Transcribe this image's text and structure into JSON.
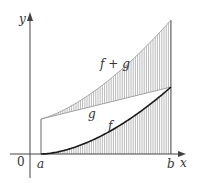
{
  "figure": {
    "type": "sum of functions area diagram",
    "axes": {
      "x_label": "x",
      "y_label": "y",
      "origin_label": "0"
    },
    "interval": {
      "start_label": "a",
      "end_label": "b"
    },
    "curves": [
      {
        "name": "f",
        "label": "f",
        "description": "increasing convex curve from 0 at a",
        "color": "#1a1a1a"
      },
      {
        "name": "g",
        "label": "g",
        "description": "straight increasing line",
        "color": "#999999"
      },
      {
        "name": "f_plus_g",
        "label": "f + g",
        "description": "sum curve, top boundary",
        "color": "#999999"
      }
    ],
    "shading": "vertical hatching under f and between g and f + g",
    "colors": {
      "axis": "#444444",
      "hatch": "#8a8a8a",
      "f_curve": "#1a1a1a",
      "background": "#ffffff"
    }
  }
}
